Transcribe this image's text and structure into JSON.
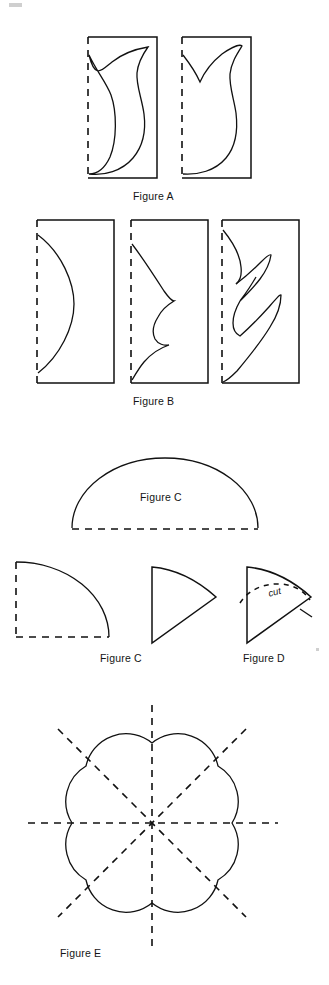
{
  "document": {
    "kind": "instructional-figure-plate",
    "background_color": "#ffffff",
    "ink_color": "#111111",
    "page_width": 329,
    "page_height": 985
  },
  "captions": {
    "figure_a": "Figure A",
    "figure_b": "Figure B",
    "figure_c_dome": "Figure C",
    "figure_c_quarter": "Figure C",
    "figure_d": "Figure D",
    "figure_e": "Figure E"
  },
  "annotations": {
    "cut": "cut"
  },
  "figures": [
    {
      "id": "figure-a",
      "label": "Figure A",
      "panels": 2,
      "description": "Two rectangles, each with a dashed fold line on the left edge and a curved tulip/leaf cut-out drawn inside"
    },
    {
      "id": "figure-b",
      "label": "Figure B",
      "panels": 3,
      "description": "Three rectangles with dashed fold lines on the left edge showing progressively more elaborate curved cuts: a single arc, a scalloped wave, and a multi-leaf flame"
    },
    {
      "id": "figure-c-dome",
      "label": "Figure C",
      "panels": 1,
      "description": "A semicircular dome with a dashed straight base line"
    },
    {
      "id": "figure-c-quarter",
      "label": "Figure C",
      "panels": 1,
      "description": "A quarter circle with dashed left edge and dashed bottom edge"
    },
    {
      "id": "figure-d",
      "label": "Figure D",
      "panels": 1,
      "description": "A folded cone/sector with a dashed arc near the outer tip marked cut"
    },
    {
      "id": "figure-e",
      "label": "Figure E",
      "panels": 1,
      "description": "An eight-petal scalloped flower with four dashed fold lines crossing through the center"
    }
  ]
}
